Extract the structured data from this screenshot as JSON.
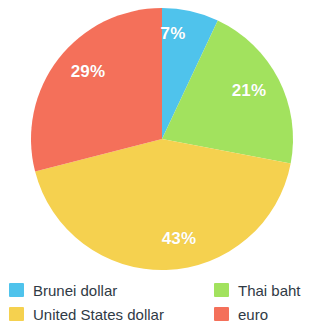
{
  "chart_data": {
    "type": "pie",
    "title": "",
    "subtitle": "",
    "xlabel": "",
    "ylabel": "",
    "legend_position": "bottom",
    "grid": false,
    "categories": [
      "Brunei dollar",
      "Thai baht",
      "United States dollar",
      "euro"
    ],
    "values": [
      7,
      21,
      43,
      29
    ],
    "value_unit": "%",
    "data_labels": [
      "7%",
      "21%",
      "43%",
      "29%"
    ],
    "colors": [
      "#4FC3EC",
      "#A2E25E",
      "#F5D14F",
      "#F4705A"
    ],
    "slices": [
      {
        "label": "Brunei dollar",
        "value": 7,
        "data_label": "7%",
        "color": "#4FC3EC",
        "start_angle": 0,
        "end_angle": 25.2,
        "label_x": 173,
        "label_y": 34
      },
      {
        "label": "Thai baht",
        "value": 21,
        "data_label": "21%",
        "color": "#A2E25E",
        "start_angle": 25.2,
        "end_angle": 100.8,
        "label_x": 249,
        "label_y": 91
      },
      {
        "label": "United States dollar",
        "value": 43,
        "data_label": "43%",
        "color": "#F5D14F",
        "start_angle": 100.8,
        "end_angle": 255.6,
        "label_x": 179,
        "label_y": 239
      },
      {
        "label": "euro",
        "value": 29,
        "data_label": "29%",
        "color": "#F4705A",
        "start_angle": 255.6,
        "end_angle": 360,
        "label_x": 88,
        "label_y": 72
      }
    ]
  },
  "legend": {
    "items": [
      {
        "label": "Brunei dollar",
        "color": "#4FC3EC"
      },
      {
        "label": "Thai baht",
        "color": "#A2E25E"
      },
      {
        "label": "United States dollar",
        "color": "#F5D14F"
      },
      {
        "label": "euro",
        "color": "#F4705A"
      }
    ]
  },
  "geometry": {
    "center_x": 162,
    "center_y": 139,
    "radius": 131
  }
}
